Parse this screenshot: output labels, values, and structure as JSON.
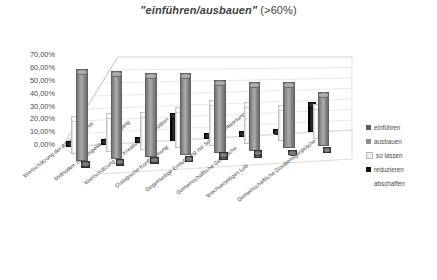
{
  "chart_data": {
    "type": "bar",
    "title_quoted": "\"einführen/ausbauen\"",
    "title_suffix": " (>60%)",
    "title_full": "\"einführen/ausbauen\" (>60%)",
    "style": "3d-cylinder-column",
    "xlabel": "",
    "ylabel": "",
    "ylim": [
      0,
      70
    ],
    "ytick_labels": [
      "70,00%",
      "60,00%",
      "50,00%",
      "40,00%",
      "30,00%",
      "20,00%",
      "10,00%",
      "0,00%"
    ],
    "ytick_values": [
      70,
      60,
      50,
      40,
      30,
      20,
      10,
      0
    ],
    "grid": true,
    "legend_position": "right",
    "categories": [
      "Wertschätzung der Arbeit Einzelner",
      "Methoden zum respektvollen Umgang",
      "Wertschätzung der Kreativität von Brüdern",
      "Dialogische Konfliktlösung",
      "Gegenseitige Ermutigung zur Selbstverantwortung",
      "Gemeinschaftliche Gespräche",
      "Wechselseitiges Lob",
      "Gemeinschaftliche Glaubensgespräche"
    ],
    "series": [
      {
        "name": "einführen",
        "color": "#5e5e5e",
        "values": [
          4,
          4,
          4,
          3,
          4,
          4,
          3,
          3
        ]
      },
      {
        "name": "ausbauen",
        "color": "#8f8f8f",
        "values": [
          70,
          67,
          64,
          62,
          55,
          52,
          50,
          41
        ]
      },
      {
        "name": "so lassen",
        "color": "#f2f2f2",
        "values": [
          28,
          29,
          28,
          30,
          34,
          31,
          27,
          26
        ]
      },
      {
        "name": "reduzieren",
        "color": "#111111",
        "values": [
          3,
          3,
          3,
          20,
          3,
          3,
          3,
          22
        ]
      },
      {
        "name": "abschaffen",
        "color": "#d9d9d9",
        "values": [
          0,
          0,
          0,
          0,
          0,
          0,
          0,
          0
        ]
      }
    ]
  },
  "legend": {
    "items": [
      {
        "label": "einführen",
        "swatch": "#5e5e5e",
        "has_swatch": true
      },
      {
        "label": "ausbauen",
        "swatch": "#8f8f8f",
        "has_swatch": true
      },
      {
        "label": "so lassen",
        "swatch": "#ededed",
        "has_swatch": true
      },
      {
        "label": "reduzieren",
        "swatch": "#111111",
        "has_swatch": true
      },
      {
        "label": "abschaffen",
        "swatch": "transparent",
        "has_swatch": false
      }
    ]
  }
}
